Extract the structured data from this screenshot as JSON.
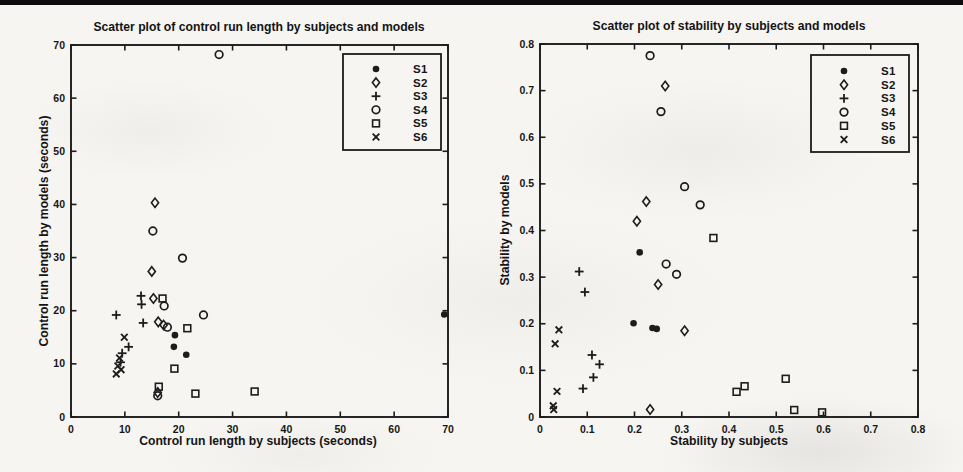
{
  "page": {
    "background": "#f6f5f2",
    "ink": "#1c1c1c",
    "text_color": "#141414",
    "top_rule_color": "#0d0d0d"
  },
  "chart_data": [
    {
      "id": "control-run-length-scatter",
      "type": "scatter",
      "title": "Scatter plot of control run length by subjects and models",
      "xlabel": "Control run length by subjects (seconds)",
      "ylabel": "Control run length by models (seconds)",
      "xlim": [
        0,
        70
      ],
      "ylim": [
        0,
        70
      ],
      "xticks": [
        0,
        10,
        20,
        30,
        40,
        50,
        60,
        70
      ],
      "xtick_labels": [
        "0",
        "10",
        "20",
        "30",
        "40",
        "50",
        "60",
        "70"
      ],
      "yticks": [
        0,
        10,
        20,
        30,
        40,
        50,
        60,
        70
      ],
      "ytick_labels": [
        "0",
        "10",
        "20",
        "30",
        "40",
        "50",
        "60",
        "70"
      ],
      "grid": false,
      "legend_position": "top-right",
      "series": [
        {
          "name": "S1",
          "marker": "filled-circle",
          "points": [
            [
              19.3,
              15.4
            ],
            [
              19.1,
              13.2
            ],
            [
              21.4,
              11.7
            ],
            [
              69.3,
              19.3
            ]
          ]
        },
        {
          "name": "S2",
          "marker": "diamond",
          "points": [
            [
              15.6,
              40.3
            ],
            [
              15.0,
              27.4
            ],
            [
              15.3,
              22.3
            ],
            [
              16.2,
              17.9
            ],
            [
              17.2,
              17.3
            ],
            [
              16.1,
              4.6
            ]
          ]
        },
        {
          "name": "S3",
          "marker": "plus",
          "points": [
            [
              8.4,
              19.2
            ],
            [
              13.0,
              22.8
            ],
            [
              13.1,
              21.2
            ],
            [
              13.4,
              17.7
            ],
            [
              10.7,
              13.2
            ],
            [
              9.5,
              12.0
            ],
            [
              9.2,
              10.3
            ]
          ]
        },
        {
          "name": "S4",
          "marker": "circle",
          "points": [
            [
              27.5,
              68.2
            ],
            [
              15.2,
              35.0
            ],
            [
              20.7,
              29.9
            ],
            [
              17.3,
              20.9
            ],
            [
              17.9,
              16.9
            ],
            [
              24.6,
              19.2
            ],
            [
              16.1,
              4.0
            ]
          ]
        },
        {
          "name": "S5",
          "marker": "square",
          "points": [
            [
              17.0,
              22.3
            ],
            [
              21.6,
              16.7
            ],
            [
              19.2,
              9.1
            ],
            [
              16.3,
              5.7
            ],
            [
              23.1,
              4.4
            ],
            [
              34.1,
              4.8
            ]
          ]
        },
        {
          "name": "S6",
          "marker": "x",
          "points": [
            [
              9.9,
              15.0
            ],
            [
              9.0,
              11.1
            ],
            [
              8.7,
              9.6
            ],
            [
              9.3,
              8.9
            ],
            [
              8.4,
              8.1
            ]
          ]
        }
      ]
    },
    {
      "id": "stability-scatter",
      "type": "scatter",
      "title": "Scatter plot of stability by subjects and models",
      "xlabel": "Stability by subjects",
      "ylabel": "Stability by models",
      "xlim": [
        0,
        0.8
      ],
      "ylim": [
        0,
        0.8
      ],
      "xticks": [
        0,
        0.1,
        0.2,
        0.3,
        0.4,
        0.5,
        0.6,
        0.7,
        0.8
      ],
      "xtick_labels": [
        "0",
        "0.1",
        "0.2",
        "0.3",
        "0.4",
        "0.5",
        "0.6",
        "0.7",
        "0.8"
      ],
      "yticks": [
        0,
        0.1,
        0.2,
        0.3,
        0.4,
        0.5,
        0.6,
        0.7,
        0.8
      ],
      "ytick_labels": [
        "0",
        "0.1",
        "0.2",
        "0.3",
        "0.4",
        "0.5",
        "0.6",
        "0.7",
        "0.8"
      ],
      "grid": false,
      "legend_position": "top-right",
      "series": [
        {
          "name": "S1",
          "marker": "filled-circle",
          "points": [
            [
              0.211,
              0.353
            ],
            [
              0.198,
              0.201
            ],
            [
              0.238,
              0.191
            ],
            [
              0.247,
              0.189
            ]
          ]
        },
        {
          "name": "S2",
          "marker": "diamond",
          "points": [
            [
              0.265,
              0.71
            ],
            [
              0.225,
              0.462
            ],
            [
              0.205,
              0.42
            ],
            [
              0.25,
              0.284
            ],
            [
              0.306,
              0.185
            ],
            [
              0.233,
              0.016
            ]
          ]
        },
        {
          "name": "S3",
          "marker": "plus",
          "points": [
            [
              0.083,
              0.312
            ],
            [
              0.095,
              0.268
            ],
            [
              0.11,
              0.133
            ],
            [
              0.126,
              0.113
            ],
            [
              0.113,
              0.085
            ],
            [
              0.091,
              0.061
            ]
          ]
        },
        {
          "name": "S4",
          "marker": "circle",
          "points": [
            [
              0.233,
              0.775
            ],
            [
              0.256,
              0.655
            ],
            [
              0.306,
              0.494
            ],
            [
              0.339,
              0.455
            ],
            [
              0.267,
              0.328
            ],
            [
              0.289,
              0.306
            ]
          ]
        },
        {
          "name": "S5",
          "marker": "square",
          "points": [
            [
              0.367,
              0.384
            ],
            [
              0.433,
              0.066
            ],
            [
              0.416,
              0.054
            ],
            [
              0.52,
              0.082
            ],
            [
              0.538,
              0.015
            ],
            [
              0.597,
              0.01
            ]
          ]
        },
        {
          "name": "S6",
          "marker": "x",
          "points": [
            [
              0.04,
              0.187
            ],
            [
              0.032,
              0.157
            ],
            [
              0.036,
              0.055
            ],
            [
              0.028,
              0.024
            ],
            [
              0.029,
              0.016
            ]
          ]
        }
      ]
    }
  ]
}
